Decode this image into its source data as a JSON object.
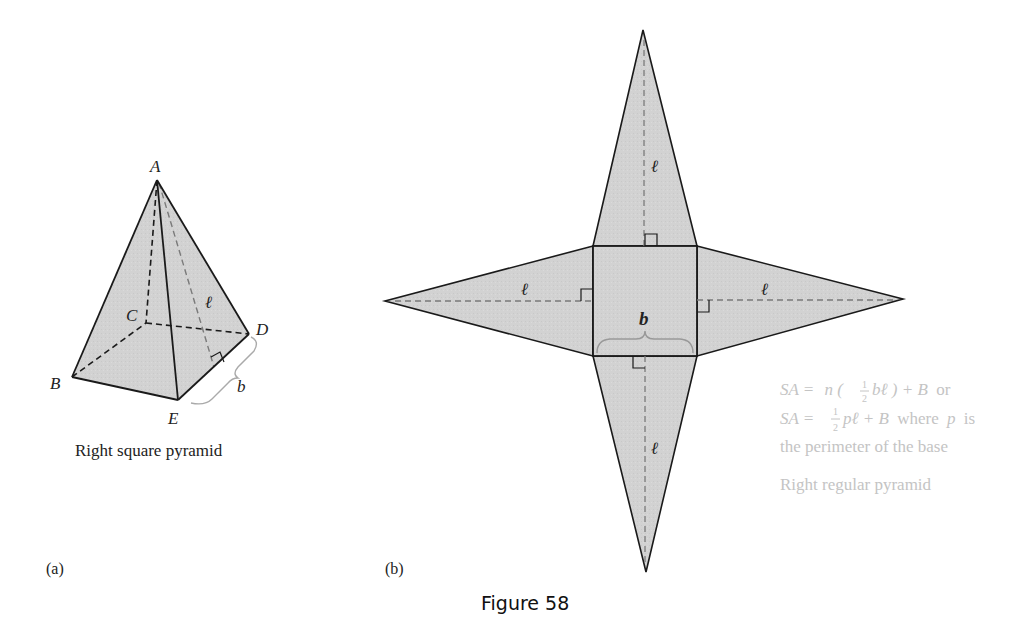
{
  "figure": {
    "title": "Figure 58",
    "colors": {
      "face_fill": "#d2d2d2",
      "edge": "#1a1a1a",
      "dashed": "#555555",
      "faded_text": "#c4c4c4"
    }
  },
  "panel_a": {
    "tag": "(a)",
    "caption": "Right square pyramid",
    "vertices": {
      "A": "A",
      "B": "B",
      "C": "C",
      "D": "D",
      "E": "E"
    },
    "slant_label": "ℓ",
    "base_label": "b"
  },
  "panel_b": {
    "tag": "(b)",
    "base_label": "b",
    "slant_labels": {
      "top": "ℓ",
      "left": "ℓ",
      "right": "ℓ",
      "bottom": "ℓ"
    },
    "formula": {
      "line1_a": "SA =",
      "line1_b": "n (",
      "line1_frac_num": "1",
      "line1_frac_den": "2",
      "line1_c": "bℓ",
      "line1_d": ") + B",
      "line1_e": "or",
      "line2_a": "SA =",
      "line2_frac_num": "1",
      "line2_frac_den": "2",
      "line2_b": "pℓ + B",
      "line2_c": "where",
      "line2_d": "p",
      "line2_e": "is",
      "line3": "the perimeter of the base",
      "caption": "Right regular pyramid"
    }
  }
}
